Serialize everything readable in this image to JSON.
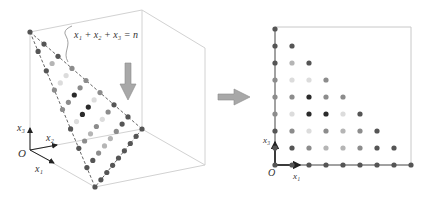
{
  "left_panel": {
    "equation_label": "x₁ + x₂ + x₃ = n",
    "axes": {
      "origin": "O",
      "x1": "x₁",
      "x2": "x₂",
      "x3": "x₃"
    },
    "n": 8
  },
  "right_panel": {
    "axes": {
      "origin": "O",
      "x1": "x₁",
      "x3": "x₃"
    },
    "grid_size": 8,
    "rows_top_to_bottom": [
      [
        "dark"
      ],
      [
        "dark",
        "dark"
      ],
      [
        "dark",
        "light",
        "dark"
      ],
      [
        "mid",
        "xlight",
        "xlight",
        "mid"
      ],
      [
        "mid",
        "mid",
        "black",
        "mid",
        "mid"
      ],
      [
        "mid",
        "xlight",
        "black",
        "black",
        "xlight",
        "dark"
      ],
      [
        "dark",
        "mid",
        "xlight",
        "mid",
        "light",
        "mid",
        "dark"
      ],
      [
        "dark",
        "dark",
        "mid",
        "light",
        "light",
        "mid",
        "dark",
        "dark"
      ],
      [
        "dark",
        "dark",
        "dark",
        "dark",
        "dark",
        "dark",
        "dark",
        "dark",
        "dark"
      ]
    ]
  },
  "colors": {
    "black": "#2a2a2a",
    "dark": "#555555",
    "mid": "#8c8c8c",
    "light": "#b5b5b5",
    "xlight": "#dcdcdc",
    "box": "#cfcfcf",
    "arrow_fill": "#a8a8a8",
    "arrow_stroke": "#8a8a8a"
  }
}
